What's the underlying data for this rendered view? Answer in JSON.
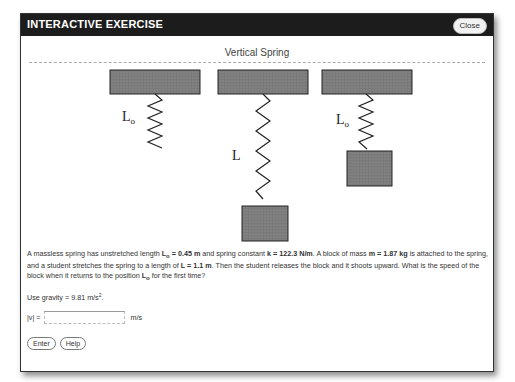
{
  "window": {
    "title": "INTERACTIVE EXERCISE",
    "close_label": "Close"
  },
  "exercise": {
    "heading": "Vertical Spring",
    "figure": {
      "labels": {
        "left": "L",
        "left_sub": "o",
        "middle": "L",
        "right": "L",
        "right_sub": "o"
      },
      "panels": [
        "unstretched spring L_o",
        "stretched spring L with block",
        "spring at L_o with block"
      ]
    },
    "problem": {
      "p1": "A massless spring has unstretched length ",
      "lo_sym": "L",
      "lo_sub": "o",
      "lo_val": " = 0.45 m",
      "p2": " and spring constant ",
      "k_val": "k = 122.3 N/m",
      "p3": ". A block of mass ",
      "m_val": "m = 1.87 kg",
      "p4": " is attached to the spring, and a student stretches the spring to a length of ",
      "l_val": "L = 1.1 m",
      "p5": ". Then the student releases the block and it shoots upward. What is the speed of the block when it returns to the position ",
      "lo2_sym": "L",
      "lo2_sub": "o",
      "p6": " for the first time?"
    },
    "gravity": {
      "text": "Use gravity = 9.81 m/s",
      "sup": "2",
      "end": "."
    },
    "answer": {
      "label": "|v| =",
      "value": "",
      "unit": "m/s"
    },
    "buttons": {
      "enter": "Enter",
      "help": "Help"
    }
  }
}
